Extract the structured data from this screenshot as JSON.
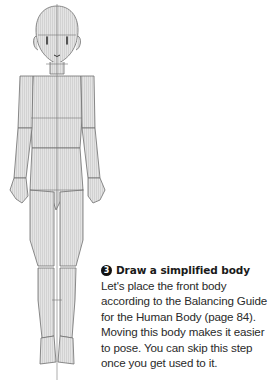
{
  "step": {
    "number": "3",
    "title": "Draw a simplified body",
    "body_lines": [
      "Let's place the front body",
      "according to the Balancing Guide",
      "for the Human Body (page 84).",
      "Moving this body makes it easier",
      "to pose. You can skip this step",
      "once you get used to it."
    ]
  },
  "figure": {
    "fill": "#dcdcdc",
    "stroke": "#6e6e6e",
    "label": "simplified-body-mannequin"
  }
}
